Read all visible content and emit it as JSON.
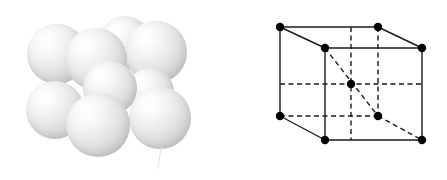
{
  "figure": {
    "background_color": "#ffffff",
    "width": 447,
    "height": 180
  },
  "sphere_model": {
    "label": "Hard-sphere packing model",
    "sphere_count": 9,
    "sphere_fill": "#dcdcdc",
    "highlight_color": "#ffffff",
    "shadow_color": "#bebebe",
    "spheres": [
      {
        "name": "corner-sphere-back-top-left",
        "cx": 57,
        "cy": 54,
        "r": 30,
        "z": 2
      },
      {
        "name": "corner-sphere-back-top-right",
        "cx": 125,
        "cy": 43,
        "r": 27,
        "z": 1
      },
      {
        "name": "corner-sphere-front-top-left",
        "cx": 96,
        "cy": 59,
        "r": 31,
        "z": 4
      },
      {
        "name": "corner-sphere-front-top-right",
        "cx": 156,
        "cy": 52,
        "r": 31,
        "z": 3
      },
      {
        "name": "center-sphere",
        "cx": 110,
        "cy": 88,
        "r": 27,
        "z": 5
      },
      {
        "name": "corner-sphere-back-bottom-left",
        "cx": 55,
        "cy": 110,
        "r": 29,
        "z": 6
      },
      {
        "name": "corner-sphere-front-bottom-left",
        "cx": 98,
        "cy": 125,
        "r": 32,
        "z": 8
      },
      {
        "name": "corner-sphere-front-bottom-right",
        "cx": 160,
        "cy": 118,
        "r": 31,
        "z": 7
      },
      {
        "name": "corner-sphere-back-bottom-right",
        "cx": 150,
        "cy": 92,
        "r": 24,
        "z": 4
      }
    ],
    "artifact": {
      "name": "scratch-mark",
      "x": 159,
      "y": 147,
      "w": 1,
      "h": 22
    }
  },
  "unit_cell": {
    "label": "Body-centered cubic unit cell",
    "line_color": "#1a1a1a",
    "atom_color": "#000000",
    "solid_stroke_width": 1.4,
    "dashed_stroke_width": 1.4,
    "dash_pattern": "5,3.5",
    "atom_radius": 4.2,
    "atoms": [
      {
        "name": "atom-back-top-left",
        "x": 57,
        "y": 27,
        "hidden": false
      },
      {
        "name": "atom-back-top-right",
        "x": 155,
        "y": 27,
        "hidden": false
      },
      {
        "name": "atom-front-top-left",
        "x": 102,
        "y": 48,
        "hidden": false
      },
      {
        "name": "atom-front-top-right",
        "x": 199,
        "y": 48,
        "hidden": false
      },
      {
        "name": "atom-back-bottom-left",
        "x": 57,
        "y": 116,
        "hidden": false
      },
      {
        "name": "atom-back-bottom-right",
        "x": 155,
        "y": 116,
        "hidden": true
      },
      {
        "name": "atom-front-bottom-left",
        "x": 102,
        "y": 140,
        "hidden": false
      },
      {
        "name": "atom-front-bottom-right",
        "x": 199,
        "y": 140,
        "hidden": false
      },
      {
        "name": "atom-body-center",
        "x": 128,
        "y": 84,
        "hidden": true
      }
    ],
    "solid_edges": [
      {
        "name": "edge-back-top",
        "x1": 57,
        "y1": 27,
        "x2": 155,
        "y2": 27
      },
      {
        "name": "edge-back-left-vertical",
        "x1": 57,
        "y1": 27,
        "x2": 57,
        "y2": 116
      },
      {
        "name": "edge-back-bottom-left-diagonal",
        "x1": 57,
        "y1": 116,
        "x2": 102,
        "y2": 140
      },
      {
        "name": "edge-back-top-left-diagonal",
        "x1": 57,
        "y1": 27,
        "x2": 102,
        "y2": 48
      },
      {
        "name": "edge-back-top-right-diagonal",
        "x1": 155,
        "y1": 27,
        "x2": 199,
        "y2": 48
      },
      {
        "name": "edge-front-top",
        "x1": 102,
        "y1": 48,
        "x2": 199,
        "y2": 48
      },
      {
        "name": "edge-front-left-vertical",
        "x1": 102,
        "y1": 48,
        "x2": 102,
        "y2": 140
      },
      {
        "name": "edge-front-right-vertical",
        "x1": 199,
        "y1": 48,
        "x2": 199,
        "y2": 140
      },
      {
        "name": "edge-front-bottom",
        "x1": 102,
        "y1": 140,
        "x2": 199,
        "y2": 140
      }
    ],
    "dashed_edges": [
      {
        "name": "edge-hidden-back-bottom",
        "x1": 57,
        "y1": 116,
        "x2": 155,
        "y2": 116
      },
      {
        "name": "edge-hidden-back-right-vertical",
        "x1": 155,
        "y1": 27,
        "x2": 155,
        "y2": 116
      },
      {
        "name": "edge-hidden-bottom-right-diagonal",
        "x1": 155,
        "y1": 116,
        "x2": 199,
        "y2": 140
      },
      {
        "name": "guide-horizontal-through-center",
        "x1": 57,
        "y1": 84,
        "x2": 199,
        "y2": 84
      },
      {
        "name": "guide-vertical-through-center",
        "x1": 128,
        "y1": 27,
        "x2": 128,
        "y2": 140
      },
      {
        "name": "guide-body-diagonal",
        "x1": 102,
        "y1": 48,
        "x2": 155,
        "y2": 116
      }
    ]
  }
}
